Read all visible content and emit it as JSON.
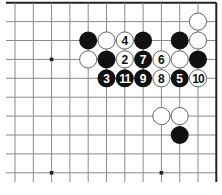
{
  "diagram": {
    "type": "go-board-fragment",
    "board_size": 19,
    "visible_region": {
      "columns": 12,
      "rows": 10,
      "edges": [
        "top",
        "right"
      ]
    },
    "colors": {
      "background": "#ffffff",
      "grid_line": "#8a8a8a",
      "edge_line": "#222222",
      "black_stone": "#111111",
      "white_stone_fill": "#ffffff",
      "white_stone_border": "#555555",
      "star_point": "#222222"
    },
    "star_points": [
      {
        "col": 2,
        "row": 3
      },
      {
        "col": 2,
        "row": 9
      },
      {
        "col": 8,
        "row": 9
      }
    ],
    "stones": [
      {
        "col": 10,
        "row": 1,
        "color": "white",
        "label": ""
      },
      {
        "col": 4,
        "row": 2,
        "color": "black",
        "label": ""
      },
      {
        "col": 5,
        "row": 2,
        "color": "white",
        "label": ""
      },
      {
        "col": 6,
        "row": 2,
        "color": "white",
        "label": "4"
      },
      {
        "col": 7,
        "row": 2,
        "color": "black",
        "label": ""
      },
      {
        "col": 9,
        "row": 2,
        "color": "black",
        "label": ""
      },
      {
        "col": 10,
        "row": 2,
        "color": "white",
        "label": ""
      },
      {
        "col": 4,
        "row": 3,
        "color": "white",
        "label": ""
      },
      {
        "col": 5,
        "row": 3,
        "color": "black",
        "label": ""
      },
      {
        "col": 6,
        "row": 3,
        "color": "white",
        "label": "2"
      },
      {
        "col": 7,
        "row": 3,
        "color": "black",
        "label": "7"
      },
      {
        "col": 8,
        "row": 3,
        "color": "white",
        "label": "6"
      },
      {
        "col": 9,
        "row": 3,
        "color": "white",
        "label": ""
      },
      {
        "col": 10,
        "row": 3,
        "color": "black",
        "label": ""
      },
      {
        "col": 5,
        "row": 4,
        "color": "black",
        "label": "3"
      },
      {
        "col": 6,
        "row": 4,
        "color": "black",
        "label": "11"
      },
      {
        "col": 7,
        "row": 4,
        "color": "black",
        "label": "9"
      },
      {
        "col": 8,
        "row": 4,
        "color": "white",
        "label": "8"
      },
      {
        "col": 9,
        "row": 4,
        "color": "black",
        "label": "5"
      },
      {
        "col": 10,
        "row": 4,
        "color": "white",
        "label": "10"
      },
      {
        "col": 8,
        "row": 6,
        "color": "white",
        "label": ""
      },
      {
        "col": 9,
        "row": 6,
        "color": "white",
        "label": ""
      },
      {
        "col": 9,
        "row": 7,
        "color": "black",
        "label": ""
      }
    ]
  }
}
